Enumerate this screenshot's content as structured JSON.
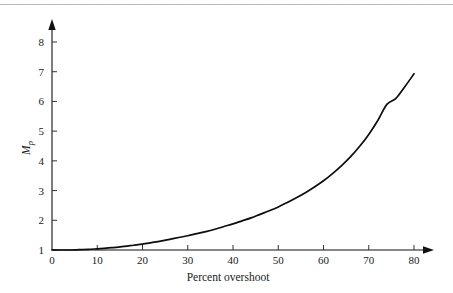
{
  "figure": {
    "background_color": "#ffffff",
    "rule_color": "#b9babd",
    "curve_color": "#0d0d0d",
    "axis_color": "#111111"
  },
  "chart_data": {
    "type": "line",
    "title": "",
    "xlabel": "Percent overshoot",
    "ylabel": "Mp",
    "ylabel_base": "M",
    "ylabel_sub": "p",
    "xlim": [
      0,
      85
    ],
    "ylim": [
      1,
      8.5
    ],
    "xticks": [
      0,
      10,
      20,
      30,
      40,
      50,
      60,
      70,
      80
    ],
    "xtick_labels": [
      "0",
      "10",
      "20",
      "30",
      "40",
      "50",
      "60",
      "70",
      "80"
    ],
    "yticks": [
      1,
      2,
      3,
      4,
      5,
      6,
      7,
      8
    ],
    "ytick_labels": [
      "1",
      "2",
      "3",
      "4",
      "5",
      "6",
      "7",
      "8"
    ],
    "grid": false,
    "legend": false,
    "x": [
      0,
      2,
      4,
      6,
      8,
      10,
      12,
      14,
      16,
      18,
      20,
      22,
      24,
      26,
      28,
      30,
      32,
      34,
      36,
      38,
      40,
      42,
      44,
      46,
      48,
      50,
      52,
      54,
      56,
      58,
      60,
      62,
      64,
      66,
      68,
      70,
      72,
      74,
      76,
      78,
      80
    ],
    "y": [
      1.0,
      1.0,
      1.0,
      1.01,
      1.02,
      1.04,
      1.06,
      1.09,
      1.12,
      1.16,
      1.2,
      1.25,
      1.3,
      1.36,
      1.42,
      1.48,
      1.55,
      1.62,
      1.7,
      1.79,
      1.88,
      1.98,
      2.08,
      2.2,
      2.32,
      2.45,
      2.6,
      2.76,
      2.93,
      3.12,
      3.33,
      3.57,
      3.84,
      4.14,
      4.49,
      4.89,
      5.36,
      5.9,
      6.1,
      6.5,
      6.93
    ],
    "annotations": []
  }
}
